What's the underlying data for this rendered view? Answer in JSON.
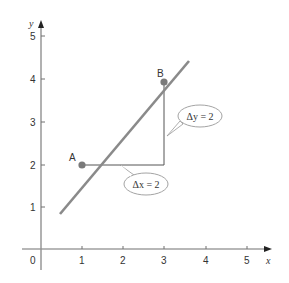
{
  "axes": {
    "x_label": "x",
    "y_label": "y",
    "origin_label": "0",
    "x_ticks": [
      "1",
      "2",
      "3",
      "4",
      "5"
    ],
    "y_ticks": [
      "1",
      "2",
      "3",
      "4",
      "5"
    ]
  },
  "points": {
    "a": {
      "label": "A",
      "x": 1,
      "y": 2
    },
    "b": {
      "label": "B",
      "x": 3,
      "y": 4
    }
  },
  "callouts": {
    "delta_x": "Δx = 2",
    "delta_y": "Δy = 2"
  },
  "colors": {
    "line": "#8a8a8a",
    "axis": "#707070",
    "point": "#7a7a7a",
    "triangle": "#555555"
  }
}
